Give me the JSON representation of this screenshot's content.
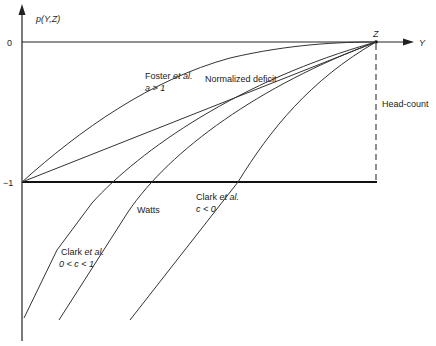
{
  "diagram": {
    "y_axis_label": "p(Y,Z)",
    "x_axis_label": "Y",
    "tick_zero": "0",
    "tick_minus_one": "−1",
    "point_label": "Z",
    "head_count_label": "Head-count",
    "normalized_deficit_label": "Normalized deficit",
    "foster": {
      "line1_name": "Foster ",
      "line1_etal": "et al.",
      "line2": "a > 1"
    },
    "watts_label": "Watts",
    "clark_neg": {
      "line1_name": "Clark ",
      "line1_etal": "et al.",
      "line2": "c < 0"
    },
    "clark_frac": {
      "line1_name": "Clark ",
      "line1_etal": "et al.",
      "line2": "0 < c < 1"
    }
  }
}
